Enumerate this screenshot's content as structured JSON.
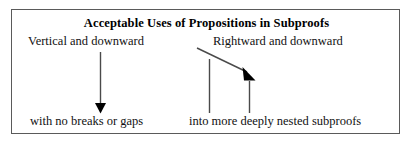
{
  "figure": {
    "title": "Acceptable Uses of Propositions in Subproofs",
    "border_color": "#5a5a5a",
    "background_color": "#ffffff",
    "left_column": {
      "top_label": "Vertical and downward",
      "bottom_label": "with no breaks or gaps",
      "arrow": {
        "name": "vertical-down-arrow",
        "color": "#4a4a4a",
        "head_color": "#000000"
      }
    },
    "right_column": {
      "top_label": "Rightward and downward",
      "bottom_label": "into more deeply nested subproofs",
      "arrow": {
        "name": "diagonal-down-right-arrow",
        "color": "#4a4a4a",
        "head_color": "#000000"
      },
      "subproof_bars": [
        {
          "name": "subproof-bar-outer"
        },
        {
          "name": "subproof-bar-inner"
        }
      ],
      "bar_color": "#4a4a4a"
    }
  }
}
